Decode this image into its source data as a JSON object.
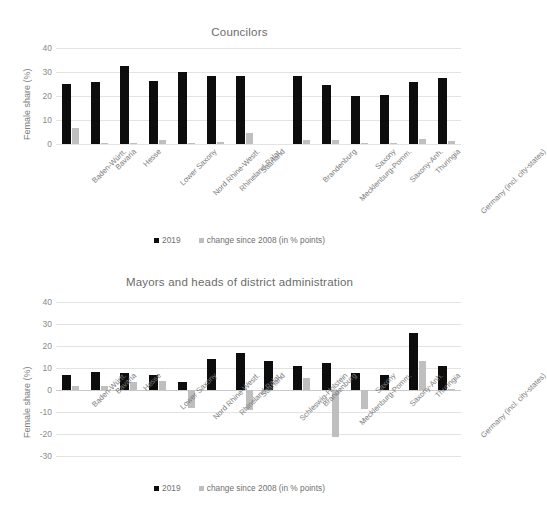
{
  "figure": {
    "background": "#ffffff",
    "series_colors": {
      "2019": "#0d0d0d",
      "change": "#bfbfbf"
    },
    "grid_color": "#e3e3e3"
  },
  "charts": [
    {
      "id": "councilors",
      "title": "Councilors",
      "ylabel": "Female share (%)",
      "legend": [
        {
          "key": "2019",
          "label": "2019",
          "color": "#0d0d0d"
        },
        {
          "key": "change",
          "label": "change since 2008 (in % points)",
          "color": "#bfbfbf"
        }
      ],
      "chart_data": {
        "type": "bar",
        "title": "Councilors",
        "xlabel": "",
        "ylabel": "Female share (%)",
        "ylim": [
          0,
          40
        ],
        "yticks": [
          0,
          10,
          20,
          30,
          40
        ],
        "grid": true,
        "legend_position": "bottom",
        "categories": [
          "Baden-Württ.",
          "Bavaria",
          "Hesse",
          "Lower Saxony",
          "Nord Rhine-Westf.",
          "Rhineland-Palat.",
          "Saarland",
          "Schleswig-Holstein",
          "Brandenburg",
          "Mecklenburg-Pomm.",
          "Saxony",
          "Saxony-Anh.",
          "Thuringia",
          "Germany (incl. city-states)"
        ],
        "visible_tick_labels": [
          "Baden-Württ.",
          "Bavaria",
          "Hesse",
          "Lower Saxony",
          "Nord Rhine-Westf.",
          "Rhineland-Palat.",
          "Saarland",
          "",
          "Brandenburg",
          "Mecklenburg-Pomm.",
          "Saxony",
          "Saxony-Anh.",
          "Thuringia",
          "Germany (incl. city-states)"
        ],
        "series": [
          {
            "name": "2019",
            "color": "#0d0d0d",
            "values": [
              24.8,
              25.9,
              32.3,
              26.3,
              29.9,
              28.2,
              28.2,
              null,
              28.3,
              24.7,
              20.0,
              20.3,
              25.9,
              27.4
            ]
          },
          {
            "name": "change since 2008 (in % points)",
            "color": "#bfbfbf",
            "values": [
              6.7,
              0.4,
              0.3,
              1.8,
              0.5,
              1.0,
              4.4,
              null,
              1.5,
              1.6,
              0.5,
              0.4,
              2.0,
              1.2
            ]
          }
        ]
      }
    },
    {
      "id": "mayors",
      "title": "Mayors and heads of district administration",
      "ylabel": "Female share (%)",
      "legend": [
        {
          "key": "2019",
          "label": "2019",
          "color": "#0d0d0d"
        },
        {
          "key": "change",
          "label": "change since 2008 (in % points)",
          "color": "#bfbfbf"
        }
      ],
      "chart_data": {
        "type": "bar",
        "title": "Mayors and heads of district administration",
        "xlabel": "",
        "ylabel": "Female share (%)",
        "ylim": [
          -30,
          40
        ],
        "yticks": [
          -30,
          -20,
          -10,
          0,
          10,
          20,
          30,
          40
        ],
        "grid": true,
        "legend_position": "bottom",
        "categories": [
          "Baden-Württ.",
          "Bavaria",
          "Hesse",
          "Lower Saxony",
          "Nord Rhine-Westf.",
          "Rhineland-Palat.",
          "Saarland",
          "Schleswig-Holstein",
          "Brandenburg",
          "Mecklenburg-Pomm.",
          "Saxony",
          "Saxony-Anh.",
          "Thuringia",
          "Germany (incl. city-states)"
        ],
        "visible_tick_labels": [
          "Baden-Württ.",
          "Bavaria",
          "Hesse",
          "Lower Saxony",
          "Nord Rhine-Westf.",
          "Rhineland-Palat.",
          "Saarland",
          "Schleswig-Holstein",
          "Brandenburg",
          "Mecklenburg-Pomm.",
          "Saxony",
          "Saxony-Anh.",
          "Thuringia",
          "Germany (incl. city-states)"
        ],
        "series": [
          {
            "name": "2019",
            "color": "#0d0d0d",
            "values": [
              6.8,
              8.2,
              7.7,
              6.7,
              3.5,
              14.0,
              16.8,
              13.3,
              11.0,
              12.4,
              7.6,
              7.0,
              26.0,
              11.0
            ]
          },
          {
            "name": "change since 2008 (in % points)",
            "color": "#bfbfbf",
            "values": [
              1.8,
              1.8,
              3.8,
              4.3,
              -8.0,
              0.0,
              -9.0,
              0.0,
              5.4,
              -21.5,
              -8.5,
              0.0,
              13.2,
              0.6
            ]
          }
        ]
      }
    }
  ]
}
